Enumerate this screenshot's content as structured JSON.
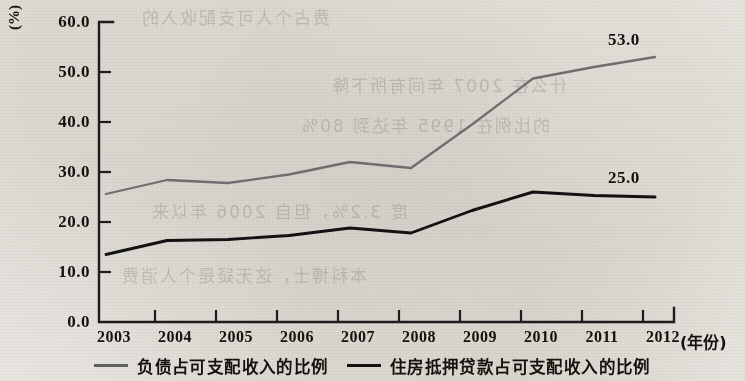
{
  "chart_data": {
    "type": "line",
    "title": "",
    "xlabel": "(年份)",
    "ylabel": "(%)",
    "unit_label": "(%)",
    "categories": [
      "2003",
      "2004",
      "2005",
      "2006",
      "2007",
      "2008",
      "2009",
      "2010",
      "2011",
      "2012"
    ],
    "x": [
      2003,
      2004,
      2005,
      2006,
      2007,
      2008,
      2009,
      2010,
      2011,
      2012
    ],
    "ylim": [
      0.0,
      60.0
    ],
    "ytick_labels": [
      "60.0",
      "50.0",
      "40.0",
      "30.0",
      "20.0",
      "10.0",
      "0.0"
    ],
    "yticks": [
      60.0,
      50.0,
      40.0,
      30.0,
      20.0,
      10.0,
      0.0
    ],
    "grid": false,
    "legend_position": "bottom",
    "series": [
      {
        "name": "负债占可支配收入的比例",
        "color": "#6e6e6e",
        "values": [
          25.6,
          28.4,
          27.8,
          29.5,
          32.0,
          30.8,
          39.5,
          48.7,
          51.0,
          53.0
        ],
        "end_label": "53.0"
      },
      {
        "name": "住房抵押贷款占可支配收入的比例",
        "color": "#121212",
        "values": [
          13.5,
          16.3,
          16.5,
          17.3,
          18.8,
          17.8,
          22.3,
          26.0,
          25.3,
          25.0
        ],
        "end_label": "25.0"
      }
    ],
    "annotations": [
      {
        "text": "53.0",
        "series": "负债占可支配收入的比例",
        "at_x": 2012
      },
      {
        "text": "25.0",
        "series": "住房抵押贷款占可支配收入的比例",
        "at_x": 2012
      }
    ]
  },
  "legend": {
    "items": [
      {
        "label": "负债占可支配收入的比例"
      },
      {
        "label": "住房抵押贷款占可支配收入的比例"
      }
    ]
  },
  "background_bleed": [
    "费占个人可支配收入的",
    "什么在 2007 年间有所下降",
    "的比例在 1995 年达到 80%",
    "度 3.2%，但自 2006 年以来",
    "本科博士，这无疑是个人消费"
  ]
}
